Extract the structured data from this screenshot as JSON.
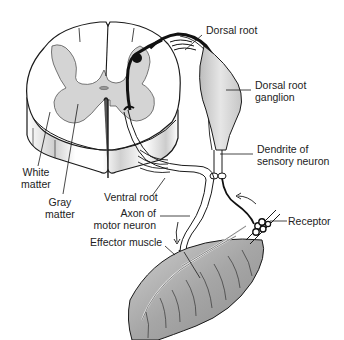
{
  "diagram": {
    "type": "anatomical-illustration",
    "colors": {
      "outline": "#1a1a1a",
      "gray_matter": "#d4d4d4",
      "white_matter": "#ffffff",
      "muscle": "#a9a9a9",
      "ganglion": "#d8d8d8",
      "label_text": "#222222"
    },
    "labels": {
      "dorsal_root": "Dorsal root",
      "dorsal_root_ganglion_line1": "Dorsal root",
      "dorsal_root_ganglion_line2": "ganglion",
      "dendrite_line1": "Dendrite of",
      "dendrite_line2": "sensory neuron",
      "white_matter_line1": "White",
      "white_matter_line2": "matter",
      "gray_matter_line1": "Gray",
      "gray_matter_line2": "matter",
      "ventral_root": "Ventral root",
      "axon_line1": "Axon of",
      "axon_line2": "motor neuron",
      "effector_muscle": "Effector muscle",
      "receptor": "Receptor"
    }
  }
}
